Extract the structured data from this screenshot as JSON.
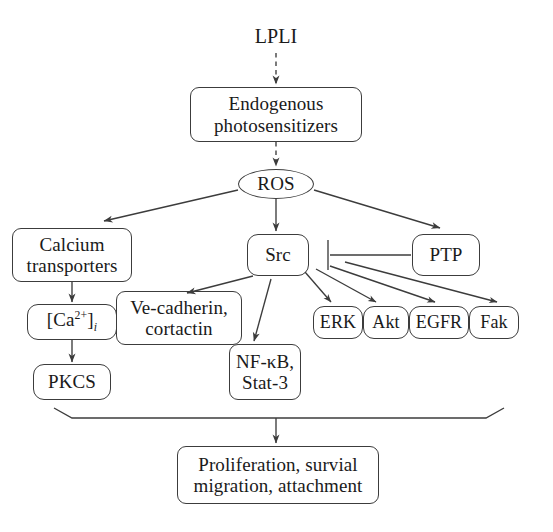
{
  "diagram": {
    "background_color": "#ffffff",
    "line_color": "#3c3c3c",
    "text_color": "#1a1a1a",
    "nodes": {
      "lpli": {
        "label": "LPLI",
        "shape": "none"
      },
      "photosensitizers": {
        "label": "Endogenous\nphotosensitizers",
        "shape": "rounded-rect"
      },
      "ros": {
        "label": "ROS",
        "shape": "ellipse"
      },
      "calcium_transporters": {
        "label": "Calcium\ntransporters",
        "shape": "rounded-rect"
      },
      "src": {
        "label": "Src",
        "shape": "rounded-rect"
      },
      "ptp": {
        "label": "PTP",
        "shape": "rounded-rect"
      },
      "calcium_ion": {
        "label": "[Ca2+]i",
        "shape": "rounded-rect"
      },
      "ve_cadherin": {
        "label": "Ve-cadherin,\ncortactin",
        "shape": "rounded-rect"
      },
      "erk": {
        "label": "ERK",
        "shape": "rounded-rect"
      },
      "akt": {
        "label": "Akt",
        "shape": "rounded-rect"
      },
      "egfr": {
        "label": "EGFR",
        "shape": "rounded-rect"
      },
      "fak": {
        "label": "Fak",
        "shape": "rounded-rect"
      },
      "nfkb": {
        "label": "NF-κB,\nStat-3",
        "shape": "rounded-rect"
      },
      "pkcs": {
        "label": "PKCS",
        "shape": "rounded-rect"
      },
      "outcomes": {
        "label": "Proliferation, survial\nmigration, attachment",
        "shape": "rounded-rect"
      }
    },
    "edges": [
      {
        "from": "lpli",
        "to": "photosensitizers",
        "style": "dashed",
        "head": "arrow"
      },
      {
        "from": "photosensitizers",
        "to": "ros",
        "style": "dashed",
        "head": "arrow"
      },
      {
        "from": "ros",
        "to": "calcium_transporters",
        "style": "solid",
        "head": "arrow"
      },
      {
        "from": "ros",
        "to": "src",
        "style": "solid",
        "head": "arrow"
      },
      {
        "from": "ros",
        "to": "ptp",
        "style": "solid",
        "head": "arrow"
      },
      {
        "from": "ptp",
        "to": "src",
        "style": "solid",
        "head": "bar"
      },
      {
        "from": "calcium_transporters",
        "to": "calcium_ion",
        "style": "solid",
        "head": "arrow"
      },
      {
        "from": "calcium_ion",
        "to": "pkcs",
        "style": "solid",
        "head": "arrow"
      },
      {
        "from": "src",
        "to": "ve_cadherin",
        "style": "solid",
        "head": "arrow"
      },
      {
        "from": "src",
        "to": "nfkb",
        "style": "solid",
        "head": "arrow"
      },
      {
        "from": "src",
        "to": "erk",
        "style": "solid",
        "head": "arrow"
      },
      {
        "from": "src",
        "to": "akt",
        "style": "solid",
        "head": "arrow"
      },
      {
        "from": "src",
        "to": "egfr",
        "style": "solid",
        "head": "arrow"
      },
      {
        "from": "src",
        "to": "fak",
        "style": "solid",
        "head": "arrow"
      },
      {
        "from": "brace",
        "to": "outcomes",
        "style": "solid",
        "head": "arrow"
      }
    ]
  }
}
